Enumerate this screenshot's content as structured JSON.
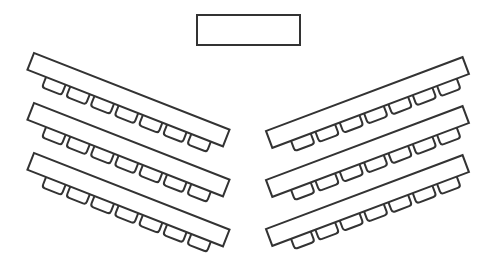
{
  "diagram": {
    "type": "classroom-seating-layout",
    "stroke_color": "#333333",
    "background": "#ffffff",
    "podium": {
      "x": 197,
      "y": 15,
      "width": 103,
      "height": 30
    },
    "table": {
      "length": 210,
      "depth": 18,
      "chairs_per_table": 7,
      "chair_width": 21,
      "chair_depth": 11,
      "chair_first_offset": 20,
      "chair_spacing": 26
    },
    "left_tables": [
      {
        "x": 34,
        "y": 53,
        "angle": 21.4
      },
      {
        "x": 34,
        "y": 103,
        "angle": 21.4
      },
      {
        "x": 34,
        "y": 153,
        "angle": 21.4
      }
    ],
    "right_tables": [
      {
        "x": 266,
        "y": 131,
        "angle": -20.6
      },
      {
        "x": 266,
        "y": 180,
        "angle": -20.6
      },
      {
        "x": 266,
        "y": 229,
        "angle": -20.6
      }
    ]
  }
}
